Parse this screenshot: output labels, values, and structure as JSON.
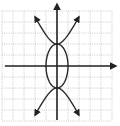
{
  "chart_data": {
    "type": "line",
    "title": "",
    "xlabel": "",
    "ylabel": "",
    "grid": true,
    "xlim": [
      -5,
      5
    ],
    "ylim": [
      -5,
      5
    ],
    "grid_step": 1,
    "series": [
      {
        "name": "ellipse",
        "equation": "x^2 + y^2/4 = 1",
        "center": [
          0,
          0
        ],
        "semi_axis_x": 1,
        "semi_axis_y": 2
      },
      {
        "name": "hyperbola",
        "equation": "y^2/4 - x^2 = 1",
        "vertices": [
          [
            0,
            2
          ],
          [
            0,
            -2
          ]
        ],
        "branch_endpoints_arrows": [
          [
            -2,
            4.47
          ],
          [
            2,
            4.47
          ],
          [
            -2,
            -4.47
          ],
          [
            2,
            -4.47
          ]
        ]
      }
    ],
    "axes": {
      "x_axis_arrow": "right",
      "y_axis_arrow": "up"
    }
  },
  "style": {
    "curve_color": "#2a2a2a",
    "axis_color": "#222222",
    "grid_color": "#bdbdbd",
    "background": "#ffffff"
  }
}
